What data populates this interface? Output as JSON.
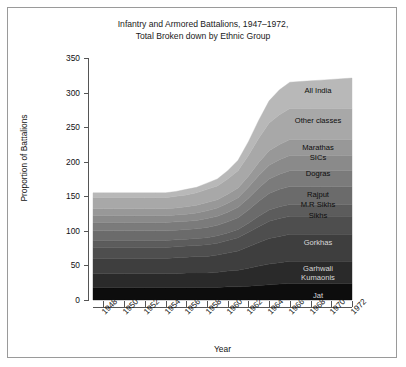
{
  "figure": {
    "title": "Infantry and Armored Battalions, 1947–1972,\nTotal Broken down by Ethnic Group",
    "border_color": "#9a9a9a",
    "background": "#ffffff"
  },
  "chart_data": {
    "type": "area",
    "stacked": true,
    "title": "Infantry and Armored Battalions, 1947–1972, Total Broken down by Ethnic Group",
    "xlabel": "Year",
    "ylabel": "Proportion of Battalions",
    "xlim": [
      1947,
      1972
    ],
    "ylim": [
      0,
      350
    ],
    "yticks": [
      0,
      50,
      100,
      150,
      200,
      250,
      300,
      350
    ],
    "xticks": [
      1948,
      1950,
      1952,
      1954,
      1956,
      1958,
      1960,
      1962,
      1964,
      1966,
      1968,
      1970,
      1972
    ],
    "grid": false,
    "legend": "inline-labels-right",
    "x": [
      1947,
      1948,
      1949,
      1950,
      1951,
      1952,
      1953,
      1954,
      1955,
      1956,
      1957,
      1958,
      1959,
      1960,
      1961,
      1962,
      1963,
      1964,
      1965,
      1966,
      1967,
      1968,
      1969,
      1970,
      1971,
      1972
    ],
    "series": [
      {
        "name": "Jat",
        "color": "#0d0d0d",
        "label_year": 1970,
        "values": [
          18,
          18,
          18,
          18,
          18,
          18,
          18,
          18,
          18,
          18,
          18,
          18,
          18,
          19,
          19,
          20,
          21,
          22,
          23,
          24,
          24,
          24,
          24,
          24,
          24,
          24
        ]
      },
      {
        "name": "Garhwali\nKumaonis",
        "color": "#2a2a2a",
        "label_year": 1969,
        "values": [
          20,
          20,
          20,
          20,
          20,
          20,
          20,
          20,
          20,
          21,
          21,
          21,
          22,
          23,
          24,
          26,
          28,
          30,
          31,
          32,
          32,
          32,
          32,
          32,
          32,
          32
        ]
      },
      {
        "name": "Gorkhas",
        "color": "#3e3e3e",
        "label_year": 1969,
        "values": [
          22,
          22,
          22,
          22,
          22,
          22,
          22,
          22,
          23,
          23,
          24,
          24,
          25,
          26,
          28,
          31,
          34,
          37,
          38,
          39,
          39,
          39,
          39,
          39,
          39,
          39
        ]
      },
      {
        "name": "Sikhs",
        "color": "#4e4e4e",
        "label_year": 1969,
        "values": [
          16,
          16,
          16,
          16,
          16,
          16,
          16,
          16,
          16,
          16,
          16,
          17,
          17,
          18,
          19,
          21,
          23,
          25,
          26,
          26,
          26,
          26,
          26,
          26,
          26,
          26
        ]
      },
      {
        "name": "M.R Sikhs",
        "color": "#5c5c5c",
        "label_year": 1969,
        "values": [
          10,
          10,
          10,
          10,
          10,
          10,
          10,
          10,
          10,
          10,
          10,
          10,
          11,
          11,
          12,
          13,
          15,
          16,
          17,
          17,
          17,
          17,
          17,
          17,
          17,
          17
        ]
      },
      {
        "name": "Rajput",
        "color": "#6b6b6b",
        "label_year": 1969,
        "values": [
          14,
          14,
          14,
          14,
          14,
          14,
          14,
          14,
          14,
          14,
          14,
          15,
          15,
          16,
          17,
          19,
          22,
          24,
          25,
          26,
          26,
          26,
          26,
          26,
          26,
          26
        ]
      },
      {
        "name": "Dogras",
        "color": "#7b7b7b",
        "label_year": 1969,
        "values": [
          12,
          12,
          12,
          12,
          12,
          12,
          12,
          12,
          12,
          12,
          12,
          13,
          13,
          14,
          15,
          17,
          19,
          21,
          22,
          23,
          23,
          23,
          23,
          23,
          23,
          23
        ]
      },
      {
        "name": "SICs",
        "color": "#8a8a8a",
        "label_year": 1969,
        "values": [
          10,
          10,
          10,
          10,
          10,
          10,
          10,
          10,
          10,
          10,
          11,
          11,
          12,
          13,
          14,
          16,
          18,
          20,
          21,
          22,
          22,
          22,
          22,
          22,
          22,
          22
        ]
      },
      {
        "name": "Marathas",
        "color": "#989898",
        "label_year": 1969,
        "values": [
          10,
          10,
          10,
          10,
          10,
          10,
          10,
          10,
          10,
          11,
          11,
          12,
          12,
          13,
          14,
          16,
          19,
          21,
          22,
          23,
          23,
          23,
          23,
          23,
          23,
          23
        ]
      },
      {
        "name": "Other classes",
        "color": "#a8a8a8",
        "label_year": 1969,
        "values": [
          16,
          16,
          16,
          16,
          16,
          16,
          16,
          16,
          17,
          17,
          18,
          19,
          20,
          22,
          25,
          30,
          35,
          40,
          43,
          45,
          45,
          45,
          45,
          45,
          45,
          45
        ]
      },
      {
        "name": "All India",
        "color": "#b8b8b8",
        "label_year": 1969,
        "values": [
          7,
          7,
          7,
          7,
          7,
          7,
          7,
          7,
          7,
          8,
          8,
          9,
          10,
          12,
          15,
          20,
          26,
          32,
          36,
          38,
          39,
          40,
          41,
          42,
          43,
          44
        ]
      }
    ],
    "series_labels": [
      {
        "text": "All India",
        "shade": "light"
      },
      {
        "text": "Other classes",
        "shade": "light"
      },
      {
        "text": "Marathas",
        "shade": "light"
      },
      {
        "text": "SICs",
        "shade": "light"
      },
      {
        "text": "Dogras",
        "shade": "light"
      },
      {
        "text": "Rajput",
        "shade": "light"
      },
      {
        "text": "M.R Sikhs",
        "shade": "light"
      },
      {
        "text": "Sikhs",
        "shade": "light"
      },
      {
        "text": "Gorkhas",
        "shade": "dark"
      },
      {
        "text": "Garhwali",
        "shade": "dark"
      },
      {
        "text": "Kumaonis",
        "shade": "dark"
      },
      {
        "text": "Jat",
        "shade": "dark"
      }
    ]
  }
}
